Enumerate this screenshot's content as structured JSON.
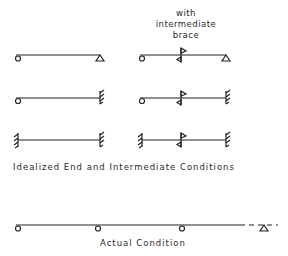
{
  "header": {
    "line1": "with",
    "line2": "intermediate",
    "line3": "brace"
  },
  "captions": {
    "idealized": "Idealized End and Intermediate Conditions",
    "actual": "Actual Condition"
  },
  "diagram": {
    "idealized_rows": [
      {
        "left": "pin",
        "right": "roller-triangle",
        "braced_variant": true
      },
      {
        "left": "pin",
        "right": "fixed-hatch",
        "braced_variant": true
      },
      {
        "left": "fixed-hatch",
        "right": "fixed-hatch",
        "braced_variant": true
      }
    ],
    "actual": {
      "supports": [
        "circle",
        "circle",
        "circle",
        "triangle"
      ],
      "continuation": "dashed"
    },
    "stroke_color": "#222222"
  }
}
